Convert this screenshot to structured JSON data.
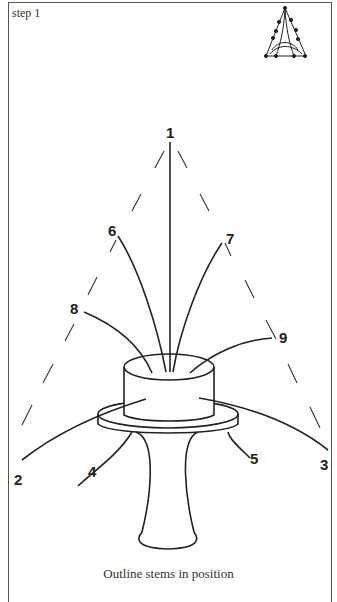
{
  "header": {
    "step_label": "step 1"
  },
  "caption": "Outline stems in position",
  "diagram": {
    "stem_labels": [
      "1",
      "2",
      "3",
      "4",
      "5",
      "6",
      "7",
      "8",
      "9"
    ],
    "thumbnail": "triangle-outline-icon",
    "shape": "triangular outline (dashed)",
    "container": "pedestal vase with cylindrical foam block"
  }
}
